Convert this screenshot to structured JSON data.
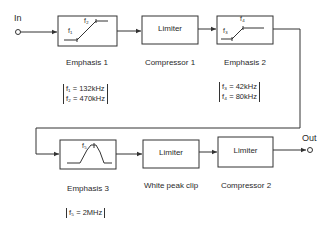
{
  "diagram": {
    "input_label": "In",
    "output_label": "Out",
    "blocks": [
      {
        "id": "emphasis1",
        "inner": "",
        "caption": "Emphasis 1",
        "curve": "shelf",
        "freq_labels": [
          "f1",
          "f2"
        ],
        "params": [
          "f₁ = 132kHz",
          "f₂ = 470kHz"
        ]
      },
      {
        "id": "compressor1",
        "inner": "Limiter",
        "caption": "Compressor 1"
      },
      {
        "id": "emphasis2",
        "inner": "",
        "caption": "Emphasis 2",
        "curve": "shelf",
        "freq_labels": [
          "f3",
          "f4"
        ],
        "params": [
          "f₃ = 42kHz",
          "f₄ = 80kHz"
        ]
      },
      {
        "id": "emphasis3",
        "inner": "",
        "caption": "Emphasis 3",
        "curve": "peak",
        "freq_labels": [
          "f5"
        ],
        "params": [
          "f₅ = 2MHz"
        ]
      },
      {
        "id": "whitepeakclip",
        "inner": "Limiter",
        "caption": "White peak clip"
      },
      {
        "id": "compressor2",
        "inner": "Limiter",
        "caption": "Compressor 2"
      }
    ],
    "sub": {
      "f1": "f₁",
      "f2": "f₂",
      "f3": "f₃",
      "f4": "f₄",
      "f5": "f₅"
    },
    "line_color": "#333333"
  }
}
